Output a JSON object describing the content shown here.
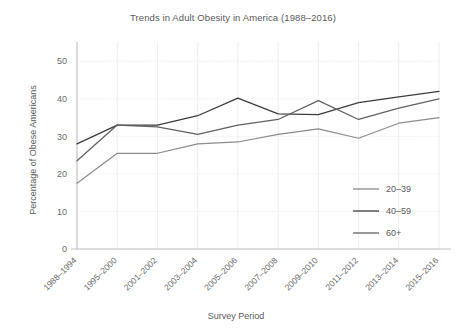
{
  "chart_data": {
    "type": "line",
    "title": "Trends in Adult Obesity in America (1988–2016)",
    "xlabel": "Survey Period",
    "ylabel": "Percentage of Obese Americans",
    "categories": [
      "1988–1994",
      "1995–2000",
      "2001–2002",
      "2003–2004",
      "2005–2006",
      "2007–2008",
      "2009–2010",
      "2011–2012",
      "2013–2014",
      "2015–2016"
    ],
    "ylim": [
      0,
      53
    ],
    "yticks": [
      0,
      10,
      20,
      30,
      40,
      50
    ],
    "ytick_labels": [
      "0",
      "10",
      "20",
      "30",
      "40",
      "50"
    ],
    "grid": true,
    "legend_position": "right-middle",
    "series": [
      {
        "name": "20–39",
        "color": "#8c8c8c",
        "values": [
          17.5,
          25.5,
          25.5,
          28.0,
          28.5,
          30.5,
          32.0,
          29.5,
          33.5,
          35.0
        ]
      },
      {
        "name": "40–59",
        "color": "#3c3c3c",
        "values": [
          28.0,
          33.0,
          33.0,
          35.5,
          40.2,
          36.0,
          35.8,
          39.0,
          40.5,
          42.0
        ]
      },
      {
        "name": "60+",
        "color": "#616161",
        "values": [
          23.5,
          33.0,
          32.5,
          30.5,
          33.0,
          34.5,
          39.5,
          34.5,
          37.5,
          40.0
        ]
      }
    ]
  },
  "colors": {
    "background": "#ffffff",
    "text": "#5a5a5a",
    "tick_text": "#6b6b6b",
    "grid": "#e2e2e2",
    "axis": "#b9b9b9"
  }
}
